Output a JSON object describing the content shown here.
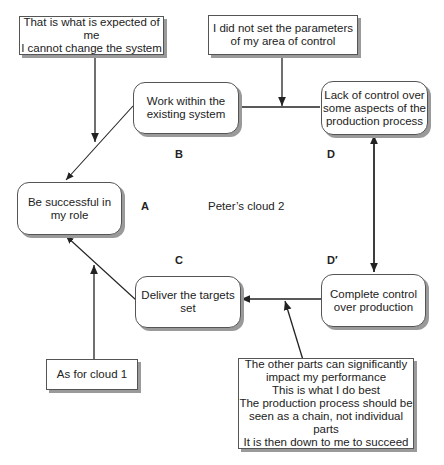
{
  "diagram": {
    "title": "Peter’s cloud 2",
    "nodes": {
      "A": {
        "letter": "A",
        "text": "Be successful in\nmy role"
      },
      "B": {
        "letter": "B",
        "text": "Work within the\nexisting system"
      },
      "C": {
        "letter": "C",
        "text": "Deliver the targets\nset"
      },
      "D": {
        "letter": "D",
        "text": "Lack of control over\nsome aspects of the\nproduction process"
      },
      "D_prime": {
        "letter": "D′",
        "text": "Complete control\nover production"
      }
    },
    "assumptions": {
      "AB": "That is what is expected of me\nI cannot change the system",
      "BD": "I did not set the parameters\nof my area of control",
      "AC": "As for cloud 1",
      "CD_prime": "The other parts can significantly\nimpact my performance\nThis is what I do best\nThe production process should be\nseen as a chain, not individual parts\nIt is then down to me to succeed"
    }
  }
}
